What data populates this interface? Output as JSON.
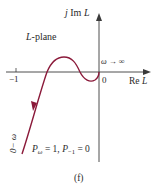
{
  "figure": {
    "panel_label": "(f)",
    "plane_label_var": "L",
    "plane_label_suffix": "-plane",
    "axes": {
      "imag_label_prefix": "j",
      "imag_label_mid": " Im ",
      "imag_label_var": "L",
      "real_label_prefix": "Re ",
      "real_label_var": "L",
      "origin_label": "0",
      "tick_minus_one": "−1"
    },
    "annotations": {
      "omega_inf": "ω → ∞",
      "zero_minus_omega": "0− ω",
      "pw_var": "P",
      "pw_sub": "ω",
      "pw_eq": " = 1, ",
      "pm1_var": "P",
      "pm1_sub": "−1",
      "pm1_eq": " = 0"
    },
    "colors": {
      "curve": "#8b1a3a",
      "axis": "#3a3a3a",
      "text": "#2a2a2a"
    }
  }
}
